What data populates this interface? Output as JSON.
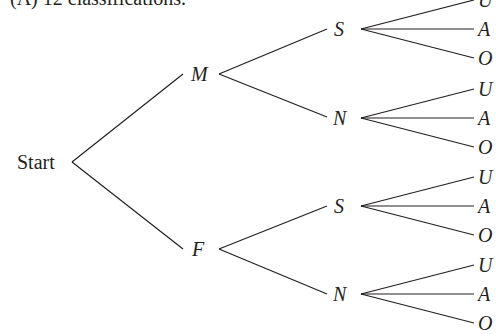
{
  "caption": "• (A) 12 classifications.",
  "root": {
    "label": "Start"
  },
  "level1": [
    {
      "label": "M"
    },
    {
      "label": "F"
    }
  ],
  "level2": [
    {
      "label": "S",
      "parent": "M"
    },
    {
      "label": "N",
      "parent": "M"
    },
    {
      "label": "S",
      "parent": "F"
    },
    {
      "label": "N",
      "parent": "F"
    }
  ],
  "leaves": [
    {
      "label": "U"
    },
    {
      "label": "A"
    },
    {
      "label": "O"
    },
    {
      "label": "U"
    },
    {
      "label": "A"
    },
    {
      "label": "O"
    },
    {
      "label": "U"
    },
    {
      "label": "A"
    },
    {
      "label": "O"
    },
    {
      "label": "U"
    },
    {
      "label": "A"
    },
    {
      "label": "O"
    }
  ],
  "colors": {
    "ink": "#231f20",
    "background": "#ffffff"
  }
}
